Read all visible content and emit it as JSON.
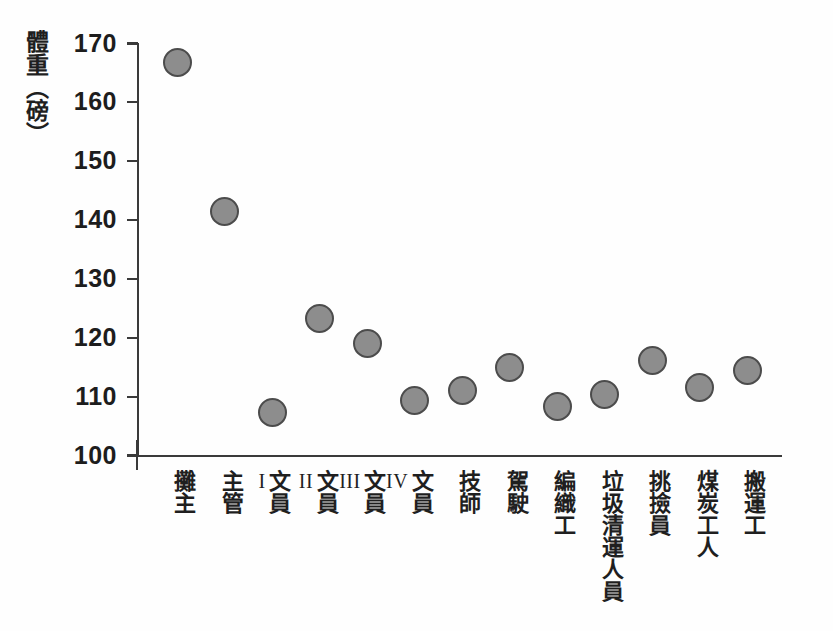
{
  "chart_data": {
    "type": "scatter",
    "title": "",
    "xlabel": "",
    "ylabel": "體重（磅）",
    "ylabel_chars": [
      "體",
      "重",
      "（",
      "磅",
      "）"
    ],
    "ylim": [
      100,
      170
    ],
    "ytick_step": 10,
    "yticks": [
      170,
      160,
      150,
      140,
      130,
      120,
      110,
      100
    ],
    "grid": false,
    "legend": null,
    "marker": {
      "shape": "circle",
      "fill_color": "#8d8d8d",
      "edge_color": "#4c4c4c",
      "size_px": 29
    },
    "categories": [
      "攤主",
      "主管",
      "文員I",
      "文員II",
      "文員III",
      "文員IV",
      "技師",
      "駕駛",
      "編織工",
      "垃圾清運人員",
      "挑撿員",
      "煤炭工人",
      "搬運工"
    ],
    "values": [
      166.8,
      141.4,
      107.3,
      123.3,
      119.0,
      109.4,
      111.0,
      115.0,
      108.3,
      110.4,
      116.1,
      111.6,
      114.4
    ]
  },
  "axis": {
    "y_title_text": "體重（磅）",
    "tick_labels": [
      "170",
      "160",
      "150",
      "140",
      "130",
      "120",
      "110",
      "100"
    ]
  },
  "categories_display": [
    {
      "cjk": "攤主",
      "roman": ""
    },
    {
      "cjk": "主管",
      "roman": ""
    },
    {
      "cjk": "文員",
      "roman": "I"
    },
    {
      "cjk": "文員",
      "roman": "II"
    },
    {
      "cjk": "文員",
      "roman": "III"
    },
    {
      "cjk": "文員",
      "roman": "IV"
    },
    {
      "cjk": "技師",
      "roman": ""
    },
    {
      "cjk": "駕駛",
      "roman": ""
    },
    {
      "cjk": "編織工",
      "roman": ""
    },
    {
      "cjk": "垃圾清運人員",
      "roman": ""
    },
    {
      "cjk": "挑撿員",
      "roman": ""
    },
    {
      "cjk": "煤炭工人",
      "roman": ""
    },
    {
      "cjk": "搬運工",
      "roman": ""
    }
  ],
  "colors": {
    "marker_fill": "#8d8d8d",
    "marker_edge": "#4c4c4c",
    "axis": "#3a3a3a",
    "text": "#1f1f1f",
    "background": "#ffffff"
  }
}
